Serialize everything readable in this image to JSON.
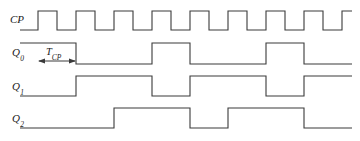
{
  "figure": {
    "kind": "digital-timing-diagram",
    "stroke_color": "#3a3a3a",
    "text_color": "#1a1a1a",
    "background_color": "#ffffff"
  },
  "annotation": {
    "period_label_main": "T",
    "period_label_sub": "CP",
    "period_label_full": "T_CP"
  },
  "signals": [
    {
      "id": "cp",
      "label_main": "CP",
      "label_sub": "",
      "label_x": 10,
      "label_y": 14,
      "baseline_y": 30,
      "top_y": 11,
      "start_level": 0,
      "description": "Clock input, 9 pulses"
    },
    {
      "id": "q0",
      "label_main": "Q",
      "label_sub": "0",
      "label_x": 12,
      "label_y": 47,
      "baseline_y": 64,
      "top_y": 43,
      "start_level": 1,
      "description": "Divide by 2 output"
    },
    {
      "id": "q1",
      "label_main": "Q",
      "label_sub": "1",
      "label_x": 12,
      "label_y": 81,
      "baseline_y": 96,
      "top_y": 76,
      "start_level": 0,
      "description": "Divide by 4 output"
    },
    {
      "id": "q2",
      "label_main": "Q",
      "label_sub": "2",
      "label_x": 12,
      "label_y": 113,
      "baseline_y": 128,
      "top_y": 108,
      "start_level": 0,
      "description": "Divide by 8 output"
    }
  ],
  "chart_data": {
    "type": "line",
    "title": "",
    "xlabel": "",
    "ylabel": "",
    "x_start": 38,
    "x_end": 352,
    "clock_period_px": 38,
    "clock_high_px": 19,
    "num_clock_pulses": 9,
    "series": [
      {
        "name": "CP",
        "transitions_x": [
          38,
          57,
          76,
          95,
          114,
          133,
          152,
          171,
          190,
          209,
          228,
          247,
          266,
          285,
          304,
          323,
          342
        ],
        "initial_level": 0,
        "final_level": 0
      },
      {
        "name": "Q0",
        "transitions_x": [
          76,
          152,
          190,
          266,
          304
        ],
        "initial_level": 1,
        "final_level": 0
      },
      {
        "name": "Q1",
        "transitions_x": [
          76,
          152,
          190,
          266,
          304
        ],
        "initial_level": 0,
        "final_level": 1
      },
      {
        "name": "Q2",
        "transitions_x": [
          114,
          190,
          228,
          304
        ],
        "initial_level": 0,
        "final_level": 0
      }
    ],
    "legend_position": "left-labels",
    "grid": false
  },
  "tcp_marker": {
    "left_x": 38,
    "right_x": 76,
    "arrow_y": 61,
    "label_x": 46,
    "label_y": 47,
    "box_top_y": 43
  }
}
